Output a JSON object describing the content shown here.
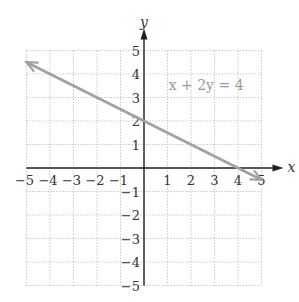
{
  "chart_data": {
    "type": "line",
    "title": "",
    "xlabel": "x",
    "ylabel": "y",
    "xlim": [
      -5,
      5
    ],
    "ylim": [
      -5,
      5
    ],
    "grid": true,
    "x_ticks": [
      "−5",
      "−4",
      "−3",
      "−2",
      "−1",
      "1",
      "2",
      "3",
      "4",
      "5"
    ],
    "y_ticks": [
      "5",
      "4",
      "3",
      "2",
      "1",
      "−1",
      "−2",
      "−3",
      "−4",
      "−5"
    ],
    "annotation": "x + 2y = 4",
    "series": [
      {
        "name": "x + 2y = 4",
        "x": [
          -5,
          5
        ],
        "y": [
          4.5,
          -0.5
        ],
        "color": "#a0a0a0",
        "arrow_ends": true
      }
    ]
  }
}
